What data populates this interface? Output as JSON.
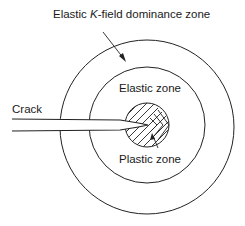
{
  "labels": {
    "kfield_pre": "Elastic ",
    "kfield_k": "K",
    "kfield_post": "-field dominance zone",
    "elastic": "Elastic zone",
    "crack": "Crack",
    "plastic": "Plastic zone"
  },
  "colors": {
    "stroke": "#222222",
    "background": "#ffffff"
  }
}
